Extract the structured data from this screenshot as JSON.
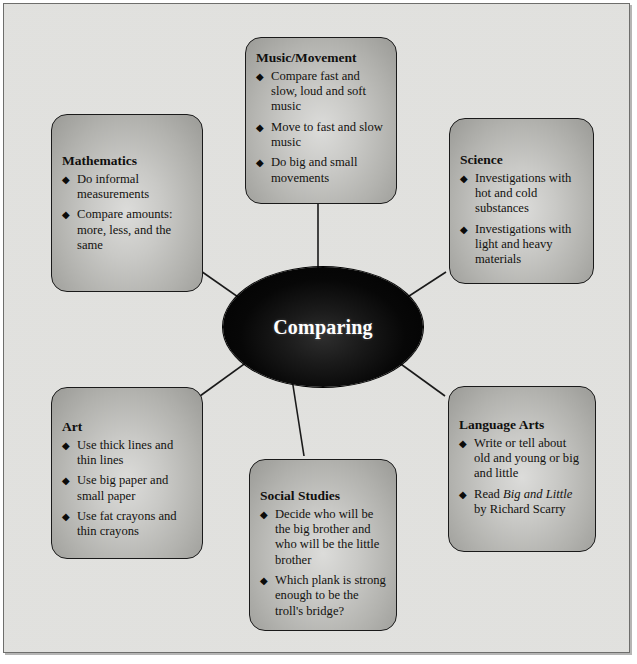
{
  "diagram": {
    "type": "web-organizer",
    "center": {
      "label": "Comparing"
    },
    "cards": [
      {
        "id": "mathematics",
        "title": "Mathematics",
        "items": [
          "Do informal measurements",
          "Compare amounts: more, less, and the same"
        ]
      },
      {
        "id": "music-movement",
        "title": "Music/Movement",
        "items": [
          "Compare fast and slow, loud and soft music",
          "Move to fast and slow music",
          "Do big and small movements"
        ]
      },
      {
        "id": "science",
        "title": "Science",
        "items": [
          "Investigations with hot and cold substances",
          "Investigations with light and heavy materials"
        ]
      },
      {
        "id": "art",
        "title": "Art",
        "items": [
          "Use thick lines and thin lines",
          "Use big paper and small paper",
          "Use fat crayons and thin crayons"
        ]
      },
      {
        "id": "social-studies",
        "title": "Social Studies",
        "items": [
          "Decide who will be the big brother and who will be the little brother",
          "Which plank is strong enough to be the troll's bridge?"
        ]
      },
      {
        "id": "language-arts",
        "title": "Language Arts",
        "items_rich": [
          {
            "parts": [
              {
                "text": "Write or tell about old and young or big and little",
                "italic": false
              }
            ]
          },
          {
            "parts": [
              {
                "text": "Read ",
                "italic": false
              },
              {
                "text": "Big and Little",
                "italic": true
              },
              {
                "text": " by Richard Scarry",
                "italic": false
              }
            ]
          }
        ]
      }
    ],
    "bullet_glyph": "◆",
    "colors": {
      "page_background": "#e3e3e0",
      "card_fill_light": "#dcdcda",
      "card_fill_dark": "#9a9a96",
      "card_border": "#1a1a1a",
      "center_fill": "#000000",
      "center_text": "#ffffff",
      "connector": "#1a1a1a",
      "body_text": "#13120f"
    }
  }
}
